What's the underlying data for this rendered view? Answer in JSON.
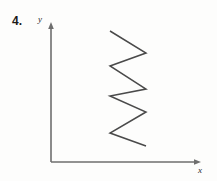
{
  "figure": {
    "problem_number": "4.",
    "axes": {
      "y_axis_label": "y",
      "x_axis_label": "x",
      "origin": {
        "x": 51,
        "y": 162
      },
      "y_axis_top": {
        "x": 51,
        "y": 22
      },
      "x_axis_right": {
        "x": 201,
        "y": 162
      },
      "stroke_color": "#6e6e6e",
      "stroke_width": 1.6,
      "arrowheads": [
        "y-axis-top",
        "x-axis-right"
      ]
    },
    "curve": {
      "name": "zigzag-curve",
      "stroke_color": "#4a4a4a",
      "stroke_width": 1.5,
      "left_x": 110,
      "right_x": 146,
      "points": [
        {
          "x": 110,
          "y": 31
        },
        {
          "x": 146,
          "y": 53
        },
        {
          "x": 110,
          "y": 66
        },
        {
          "x": 146,
          "y": 89
        },
        {
          "x": 110,
          "y": 96
        },
        {
          "x": 146,
          "y": 112
        },
        {
          "x": 110,
          "y": 133
        },
        {
          "x": 146,
          "y": 146
        }
      ]
    }
  },
  "chart_data": {
    "type": "line",
    "title": "",
    "xlabel": "x",
    "ylabel": "y",
    "grid": false,
    "legend": "none",
    "series": [
      {
        "name": "zigzag",
        "x": [
          110,
          146,
          110,
          146,
          110,
          146,
          110,
          146
        ],
        "y": [
          31,
          53,
          66,
          89,
          96,
          112,
          133,
          146
        ]
      }
    ],
    "xlim": [
      51,
      201
    ],
    "ylim": [
      162,
      22
    ]
  }
}
